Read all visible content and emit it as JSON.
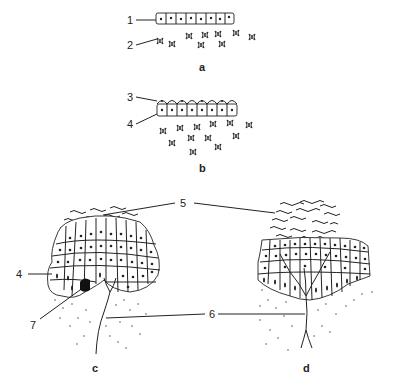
{
  "figure": {
    "panels": [
      {
        "id": "a",
        "label": "a",
        "description": "single layer of epithelial cells (1) above scattered mesenchymal cells (2)"
      },
      {
        "id": "b",
        "label": "b",
        "description": "epithelial layer with thin covering layer (3) over basal cells (4), mesenchymal cells beneath"
      },
      {
        "id": "c",
        "label": "c",
        "description": "multilayered epithelial thickening with flattened surface cells (5), basal cells (4), dark cell (7) and nerve fiber (6)"
      },
      {
        "id": "d",
        "label": "d",
        "description": "mature stratified epithelium with flaking surface layers (5) and branching nerve (6)"
      }
    ],
    "callouts": [
      {
        "number": "1",
        "target": "epithelial cell layer (a)"
      },
      {
        "number": "2",
        "target": "mesenchymal cell (a)"
      },
      {
        "number": "3",
        "target": "periderm / covering layer (b)"
      },
      {
        "number": "4",
        "target": "basal cell layer (b, c)"
      },
      {
        "number": "5",
        "target": "superficial flattened layers (c, d)"
      },
      {
        "number": "6",
        "target": "nerve fiber (c, d)"
      },
      {
        "number": "7",
        "target": "dark cell (c)"
      }
    ]
  },
  "labels": {
    "n1": "1",
    "n2": "2",
    "n3": "3",
    "n4a": "4",
    "n4b": "4",
    "n5": "5",
    "n6": "6",
    "n7": "7",
    "a": "a",
    "b": "b",
    "c": "c",
    "d": "d"
  }
}
